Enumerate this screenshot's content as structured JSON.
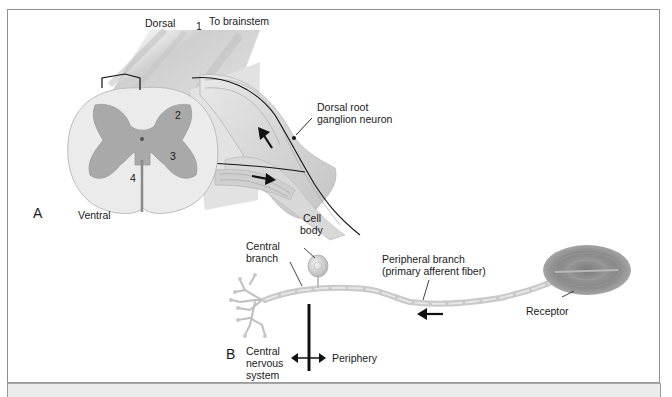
{
  "figure": {
    "panel_a": {
      "letter": "A",
      "labels": {
        "dorsal": "Dorsal",
        "to_brainstem": "To brainstem",
        "ventral": "Ventral",
        "drg_line1": "Dorsal root",
        "drg_line2": "ganglion neuron"
      },
      "numbers": [
        "1",
        "2",
        "3",
        "4"
      ]
    },
    "panel_b": {
      "letter": "B",
      "labels": {
        "cell_line1": "Cell",
        "cell_line2": "body",
        "central_line1": "Central",
        "central_line2": "branch",
        "peripheral_line1": "Peripheral branch",
        "peripheral_line2": "(primary afferent fiber)",
        "receptor": "Receptor",
        "cns_line1": "Central",
        "cns_line2": "nervous",
        "cns_line3": "system",
        "periphery": "Periphery"
      }
    },
    "colors": {
      "gray_matter": "#a8a8a8",
      "white_matter": "#ececec",
      "nerve": "#d6d6d6",
      "receptor": "#8e8e8e",
      "ink": "#111111"
    }
  }
}
